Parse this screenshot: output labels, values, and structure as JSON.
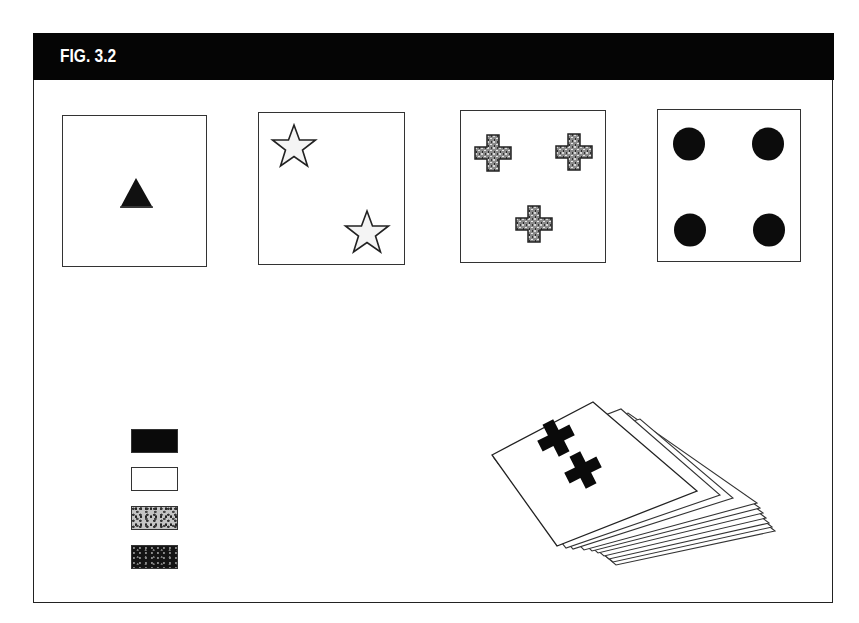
{
  "figure": {
    "title": "FIG. 3.2",
    "header_color": "#050505",
    "title_color": "#ffffff"
  },
  "cards": [
    {
      "id": "card-1",
      "shape": "triangle",
      "count": 1,
      "fill": "black",
      "fill_hex": "#111111"
    },
    {
      "id": "card-2",
      "shape": "star",
      "count": 2,
      "fill": "white",
      "fill_hex": "#f4f4f4"
    },
    {
      "id": "card-3",
      "shape": "cross",
      "count": 3,
      "fill": "speckled gray",
      "fill_hex": "#7a7a7a"
    },
    {
      "id": "card-4",
      "shape": "circle",
      "count": 4,
      "fill": "speckled black",
      "fill_hex": "#0c0c0c"
    }
  ],
  "color_key": [
    {
      "id": "swatch-black",
      "fill": "black",
      "fill_hex": "#0a0a0a"
    },
    {
      "id": "swatch-white",
      "fill": "white",
      "fill_hex": "#ffffff"
    },
    {
      "id": "swatch-speckled-gray",
      "fill": "speckled gray",
      "fill_hex": "#b8b8b8"
    },
    {
      "id": "swatch-speckled-black",
      "fill": "speckled black",
      "fill_hex": "#1a1a1a"
    }
  ],
  "deck": {
    "top_card_shape": "cross",
    "top_card_count": 2,
    "top_card_fill": "black",
    "stacked_cards": 8
  }
}
